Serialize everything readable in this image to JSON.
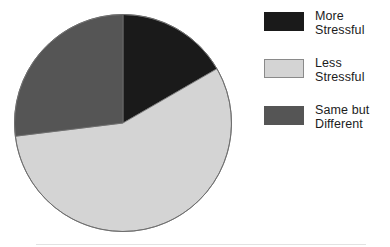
{
  "chart_data": {
    "type": "pie",
    "title": "",
    "subtitle": "",
    "xlabel": "",
    "ylabel": "",
    "grid": false,
    "legend_position": "right",
    "start_angle_deg": 0,
    "direction": "clockwise",
    "categories": [
      "More Stressful",
      "Less Stressful",
      "Same but Different"
    ],
    "values": [
      16.7,
      56.4,
      26.9
    ],
    "value_unit": "percent",
    "slices": [
      {
        "label": "More Stressful",
        "label_line1": "More",
        "label_line2": "Stressful",
        "value": 16.7,
        "start_angle_deg": 0,
        "end_angle_deg": 60,
        "color": "#1a1a1a",
        "swatch_border": false
      },
      {
        "label": "Less Stressful",
        "label_line1": "Less",
        "label_line2": "Stressful",
        "value": 56.4,
        "start_angle_deg": 60,
        "end_angle_deg": 263,
        "color": "#d4d4d4",
        "swatch_border": true
      },
      {
        "label": "Same but Different",
        "label_line1": "Same but",
        "label_line2": "Different",
        "value": 26.9,
        "start_angle_deg": 263,
        "end_angle_deg": 360,
        "color": "#555555",
        "swatch_border": false
      }
    ]
  },
  "legend": {
    "items": [
      {
        "label": "More\nStressful",
        "color": "#1a1a1a"
      },
      {
        "label": "Less\nStressful",
        "color": "#d4d4d4"
      },
      {
        "label": "Same but\nDifferent",
        "color": "#555555"
      }
    ]
  },
  "colors": {
    "background": "#ffffff",
    "more_stressful": "#1a1a1a",
    "less_stressful": "#d4d4d4",
    "same_but_different": "#555555",
    "outline": "#6e6e6e",
    "footer_rule": "#e2e2e2"
  }
}
